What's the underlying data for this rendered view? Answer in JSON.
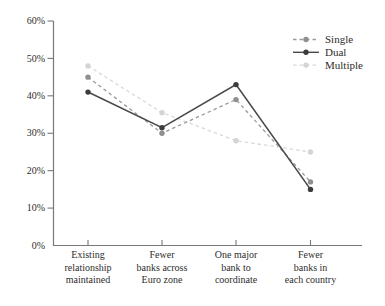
{
  "chart_data": {
    "type": "line",
    "title": "",
    "xlabel": "",
    "ylabel": "",
    "categories": [
      [
        "Existing",
        "relationship",
        "maintained"
      ],
      [
        "Fewer",
        "banks across",
        "Euro zone"
      ],
      [
        "One major",
        "bank to",
        "coordinate"
      ],
      [
        "Fewer",
        "banks in",
        "each country"
      ]
    ],
    "series": [
      {
        "name": "Single",
        "values": [
          45,
          30,
          39,
          17
        ],
        "color": "#9b9b9b",
        "marker_color": "#8f8f8f",
        "line_style": "dashed",
        "marker": "circle"
      },
      {
        "name": "Dual",
        "values": [
          41,
          31.5,
          43,
          15
        ],
        "color": "#4a4a4a",
        "marker_color": "#3c3c3c",
        "line_style": "solid",
        "marker": "circle"
      },
      {
        "name": "Multiple",
        "values": [
          48,
          35.5,
          28,
          25
        ],
        "color": "#d9d9d9",
        "marker_color": "#d4d4d4",
        "line_style": "dashed",
        "marker": "circle"
      }
    ],
    "ylim": [
      0,
      60
    ],
    "ytick_step": 10,
    "ytick_labels": [
      "0%",
      "10%",
      "20%",
      "30%",
      "40%",
      "50%",
      "60%"
    ],
    "grid": false,
    "legend_position": "top-right",
    "legend_order": [
      "Single",
      "Dual",
      "Multiple"
    ],
    "axis_color": "#787878",
    "text_color": "#2e2d2b",
    "background": "#ffffff"
  }
}
